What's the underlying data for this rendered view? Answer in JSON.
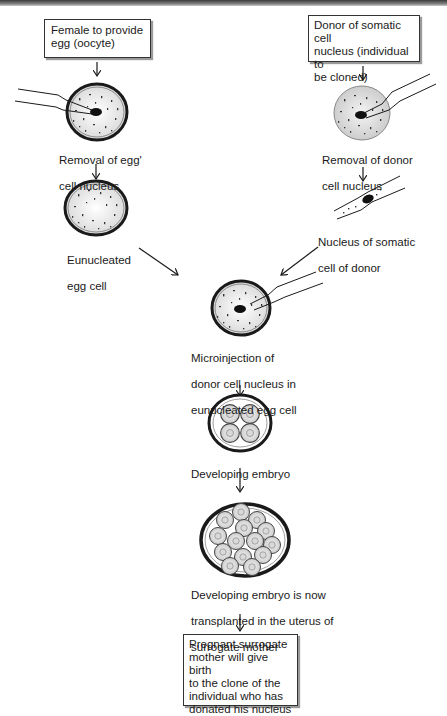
{
  "diagram": {
    "type": "flowchart",
    "colors": {
      "stroke": "#1a1a1a",
      "cell_fill": "#e6e6e6",
      "donor_cell_fill": "#dcdcdc",
      "box_border": "#333333",
      "box_shadow": "#9a9a9a",
      "top_bar": "#5a5a5a"
    },
    "boxes": {
      "female_egg": [
        "Female to provide",
        "egg (oocyte)"
      ],
      "donor": [
        "Donor of somatic cell",
        "nucleus  (individual to",
        "be cloned)"
      ],
      "result": [
        "Pregnant surrogate",
        "mother will give birth",
        "to the clone of the",
        "individual who has",
        "donated his nucleus"
      ]
    },
    "labels": {
      "removal_egg_nucleus": [
        "Removal of egg'",
        "cell nucleus"
      ],
      "enucleated_egg": [
        "Eunucleated",
        "egg cell"
      ],
      "removal_donor_nucleus": [
        "Removal of donor",
        "cell nucleus"
      ],
      "somatic_nucleus": [
        "Nucleus of somatic",
        "cell of donor"
      ],
      "microinjection": [
        "Microinjection of",
        "donor cell nucleus in",
        "eunucleated egg cell"
      ],
      "developing_embryo": [
        "Developing embryo"
      ],
      "transplanted": [
        "Developing embryo is now",
        "transplanted in the uterus of",
        "surrogate mother"
      ]
    },
    "nodes": [
      {
        "id": "female_egg",
        "kind": "box"
      },
      {
        "id": "egg_nucleus_removal",
        "kind": "cell-with-pipette"
      },
      {
        "id": "enucleated_egg",
        "kind": "cell"
      },
      {
        "id": "donor",
        "kind": "box"
      },
      {
        "id": "donor_nucleus_removal",
        "kind": "cell-with-pipette"
      },
      {
        "id": "somatic_nucleus",
        "kind": "pipette-with-nucleus"
      },
      {
        "id": "microinjection",
        "kind": "cell-with-pipette"
      },
      {
        "id": "embryo_4cell",
        "kind": "embryo",
        "cells": 4
      },
      {
        "id": "embryo_multicell",
        "kind": "embryo",
        "cells": 14
      },
      {
        "id": "result",
        "kind": "box"
      }
    ],
    "edges": [
      [
        "female_egg",
        "egg_nucleus_removal"
      ],
      [
        "egg_nucleus_removal",
        "enucleated_egg"
      ],
      [
        "enucleated_egg",
        "microinjection"
      ],
      [
        "donor",
        "donor_nucleus_removal"
      ],
      [
        "donor_nucleus_removal",
        "somatic_nucleus"
      ],
      [
        "somatic_nucleus",
        "microinjection"
      ],
      [
        "microinjection",
        "embryo_4cell"
      ],
      [
        "embryo_4cell",
        "embryo_multicell"
      ],
      [
        "embryo_multicell",
        "result"
      ]
    ]
  }
}
